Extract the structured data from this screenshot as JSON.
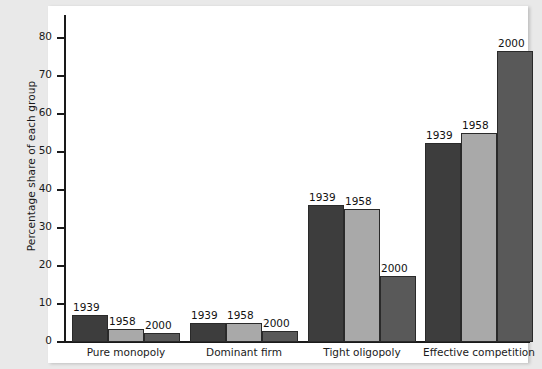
{
  "chart_data": {
    "type": "bar",
    "title": "",
    "xlabel": "",
    "ylabel": "Percentage share of each group",
    "ylim": [
      0,
      85
    ],
    "yticks": [
      0,
      10,
      20,
      30,
      40,
      50,
      60,
      70,
      80
    ],
    "ytick_labels": [
      "0",
      "10",
      "20",
      "30",
      "40",
      "50",
      "60",
      "70",
      "80"
    ],
    "grid": false,
    "legend": "none (bars labelled directly)",
    "categories": [
      "Pure monopoly",
      "Dominant firm",
      "Tight oligopoly",
      "Effective competition"
    ],
    "series": [
      {
        "name": "1939",
        "color": "#3d3d3d",
        "values": [
          7,
          5,
          36,
          52.5
        ]
      },
      {
        "name": "1958",
        "color": "#a9a9a9",
        "values": [
          3.5,
          5,
          35,
          55
        ]
      },
      {
        "name": "2000",
        "color": "#595959",
        "values": [
          2.5,
          3,
          17.5,
          76.5
        ]
      }
    ],
    "point_labels": [
      [
        "1939",
        "1958",
        "2000"
      ],
      [
        "1939",
        "1958",
        "2000"
      ],
      [
        "1939",
        "1958",
        "2000"
      ],
      [
        "1939",
        "1958",
        "2000"
      ]
    ]
  },
  "axis": {
    "y": {
      "label": "Percentage share of each group",
      "ticks": [
        {
          "value": 80,
          "label": "80"
        },
        {
          "value": 70,
          "label": "70"
        },
        {
          "value": 60,
          "label": "60"
        },
        {
          "value": 50,
          "label": "50"
        },
        {
          "value": 40,
          "label": "40"
        },
        {
          "value": 30,
          "label": "30"
        },
        {
          "value": 20,
          "label": "20"
        },
        {
          "value": 10,
          "label": "10"
        },
        {
          "value": 0,
          "label": "0"
        }
      ]
    },
    "x": {
      "categories": [
        {
          "label": "Pure monopoly"
        },
        {
          "label": "Dominant firm"
        },
        {
          "label": "Tight oligopoly"
        },
        {
          "label": "Effective competition"
        }
      ]
    }
  },
  "colors": {
    "series_1939": "#3d3d3d",
    "series_1958": "#a9a9a9",
    "series_2000": "#595959",
    "panel_background": "#ffffff",
    "page_background": "#e9e9e9",
    "axis": "#1a1a1a"
  }
}
